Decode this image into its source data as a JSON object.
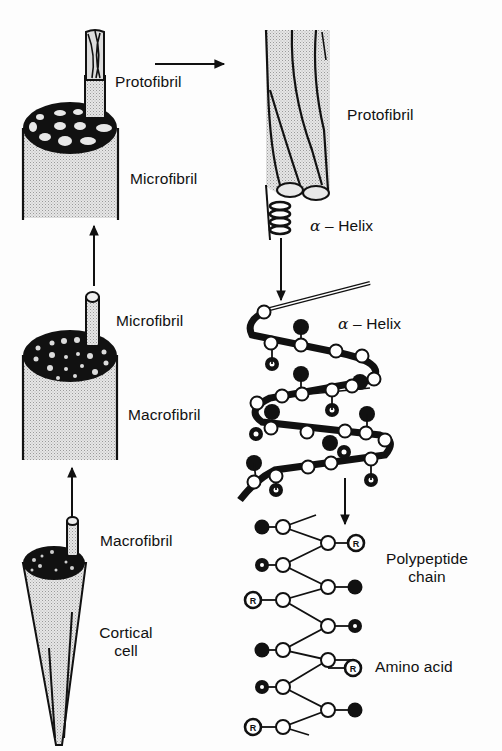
{
  "figure": {
    "colors": {
      "ink": "#111111",
      "fill_stipple": "#d8d8d8",
      "background": "#fdfdfd"
    }
  },
  "left_column": {
    "components": [
      {
        "id": "microfibril",
        "label": "Microfibril",
        "sub_label": "Protofibril"
      },
      {
        "id": "macrofibril",
        "label": "Macrofibril",
        "sub_label": "Microfibril"
      },
      {
        "id": "cortical_cell",
        "label": "Cortical cell",
        "label_line1": "Cortical",
        "label_line2": "cell",
        "sub_label": "Macrofibril"
      }
    ]
  },
  "right_column": {
    "protofibril": {
      "label": "Protofibril"
    },
    "alpha_helix_small": {
      "symbol": "α",
      "label": "– Helix"
    },
    "alpha_helix_large": {
      "symbol": "α",
      "label": "– Helix"
    },
    "polypeptide": {
      "label_line1": "Polypeptide",
      "label_line2": "chain"
    },
    "amino_acid": {
      "label": "Amino acid"
    },
    "r_group_symbol": "R"
  },
  "labels": {
    "protofibril_left": "Protofibril",
    "microfibril_left_1": "Microfibril",
    "microfibril_left_2": "Microfibril",
    "macrofibril_left_1": "Macrofibril",
    "macrofibril_left_2": "Macrofibril",
    "cortical_1": "Cortical",
    "cortical_2": "cell",
    "protofibril_right": "Protofibril",
    "helix_sym_1": "α",
    "helix_txt_1": "– Helix",
    "helix_sym_2": "α",
    "helix_txt_2": "– Helix",
    "polypeptide_1": "Polypeptide",
    "polypeptide_2": "chain",
    "amino_acid": "Amino acid",
    "r": "R"
  }
}
